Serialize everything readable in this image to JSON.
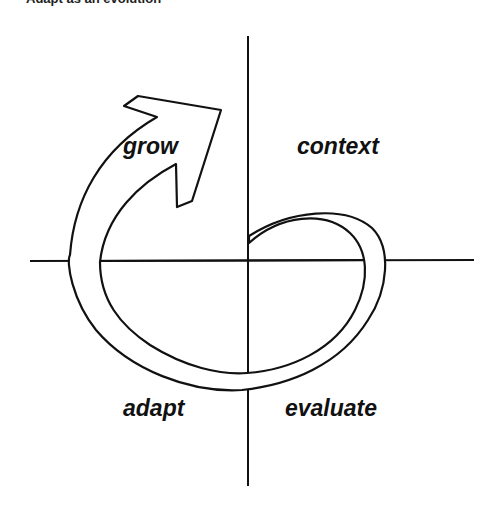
{
  "caption": "Adapt as an evolution",
  "diagram": {
    "type": "quadrant-cycle",
    "quadrants": {
      "top_left": "grow",
      "top_right": "context",
      "bottom_right": "evaluate",
      "bottom_left": "adapt"
    },
    "arrow": "cycle-arrow",
    "colors": {
      "stroke": "#111111",
      "background": "#ffffff"
    }
  }
}
